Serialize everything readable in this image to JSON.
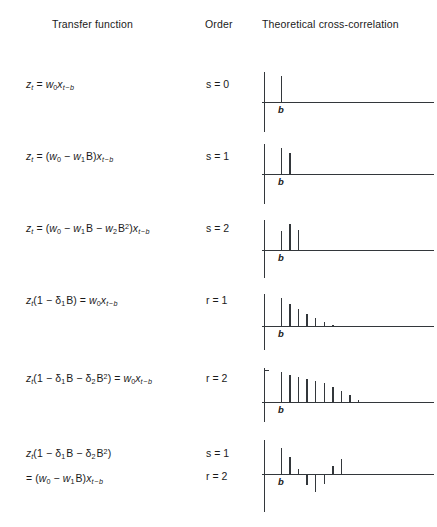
{
  "header": {
    "transfer_function": "Transfer function",
    "order": "Order",
    "cross_correlation": "Theoretical cross-correlation"
  },
  "b_label": "b",
  "rows": [
    {
      "formula_text": "z_t = w_0 x_{t-b}",
      "order_line1": "s = 0",
      "order_line2": "",
      "impulse_response": {
        "lags": [
          0,
          1,
          2,
          3,
          4,
          5,
          6,
          7,
          8,
          9
        ],
        "values": [
          0,
          1.0,
          0,
          0,
          0,
          0,
          0,
          0,
          0,
          0
        ],
        "b_index": 1
      }
    },
    {
      "formula_text": "z_t = (w_0 - w_1 B) x_{t-b}",
      "order_line1": "s = 1",
      "order_line2": "",
      "impulse_response": {
        "lags": [
          0,
          1,
          2,
          3,
          4,
          5,
          6,
          7,
          8,
          9
        ],
        "values": [
          0,
          1.0,
          0.82,
          0,
          0,
          0,
          0,
          0,
          0,
          0
        ],
        "b_index": 1
      }
    },
    {
      "formula_text": "z_t = (w_0 - w_1 B - w_2 B^2) x_{t-b}",
      "order_line1": "s = 2",
      "order_line2": "",
      "impulse_response": {
        "lags": [
          0,
          1,
          2,
          3,
          4,
          5,
          6,
          7,
          8,
          9
        ],
        "values": [
          0,
          0.72,
          1.0,
          0.78,
          0,
          0,
          0,
          0,
          0,
          0
        ],
        "b_index": 1
      }
    },
    {
      "formula_text": "z_t (1 - d_1 B) = w_0 x_{t-b}",
      "order_line1": "r = 1",
      "order_line2": "",
      "impulse_response": {
        "lags": [
          0,
          1,
          2,
          3,
          4,
          5,
          6,
          7,
          8,
          9
        ],
        "values": [
          0,
          1.0,
          0.8,
          0.62,
          0.44,
          0.28,
          0.13,
          0.05,
          0,
          0
        ],
        "b_index": 1
      }
    },
    {
      "formula_text": "z_t (1 - d_1 B - d_2 B^2) = w_0 x_{t-b}",
      "order_line1": "r = 2",
      "order_line2": "",
      "impulse_response": {
        "lags": [
          0,
          1,
          2,
          3,
          4,
          5,
          6,
          7,
          8,
          9,
          10
        ],
        "values": [
          0,
          1.0,
          0.9,
          0.84,
          0.78,
          0.7,
          0.62,
          0.5,
          0.38,
          0.22,
          0.06
        ],
        "b_index": 1,
        "y_axis_tick": true
      }
    },
    {
      "formula_text": "z_t (1 - d_1 B - d_2 B^2) = (w_0 - w_1 B) x_{t-b}",
      "order_line1": "s = 1",
      "order_line2": "r = 2",
      "impulse_response": {
        "lags": [
          0,
          1,
          2,
          3,
          4,
          5,
          6,
          7,
          8,
          9,
          10
        ],
        "values": [
          0,
          1.0,
          0.66,
          0.18,
          -0.42,
          -0.7,
          -0.38,
          0.3,
          0.56,
          0,
          0
        ],
        "b_index": 1
      }
    }
  ]
}
